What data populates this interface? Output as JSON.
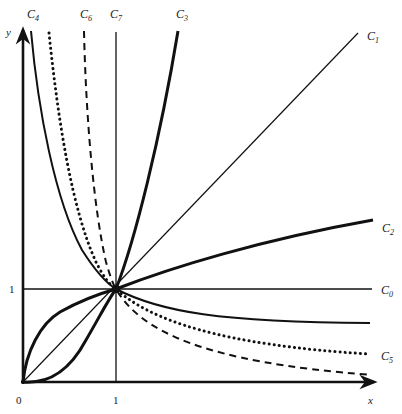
{
  "diagram": {
    "type": "function-family",
    "axes": {
      "x_label": "x",
      "y_label": "y",
      "origin_label": "0",
      "x_tick_label": "1",
      "y_tick_label": "1"
    },
    "curves": [
      {
        "id": "C0",
        "label": "C",
        "sub": "0",
        "style": "solid-thin",
        "shape": "horizontal line y=1"
      },
      {
        "id": "C1",
        "label": "C",
        "sub": "1",
        "style": "solid-thin",
        "shape": "line y=x"
      },
      {
        "id": "C2",
        "label": "C",
        "sub": "2",
        "style": "solid-thick",
        "shape": "concave increasing (0<n<1)"
      },
      {
        "id": "C3",
        "label": "C",
        "sub": "3",
        "style": "solid-thick",
        "shape": "convex increasing (n>1)"
      },
      {
        "id": "C4",
        "label": "C",
        "sub": "4",
        "style": "solid-medium",
        "shape": "decreasing (n<0, small magnitude)"
      },
      {
        "id": "C5",
        "label": "C",
        "sub": "5",
        "style": "dotted",
        "shape": "decreasing (n≈-1)"
      },
      {
        "id": "C6",
        "label": "C",
        "sub": "6",
        "style": "dashed",
        "shape": "decreasing (n<-1)"
      },
      {
        "id": "C7",
        "label": "C",
        "sub": "7",
        "style": "solid-thin",
        "shape": "vertical line x=1"
      }
    ],
    "colors": {
      "ink": "#111111",
      "background": "#ffffff"
    }
  }
}
